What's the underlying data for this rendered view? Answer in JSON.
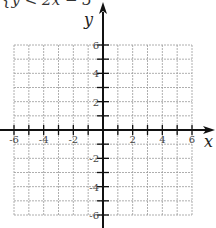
{
  "problem": {
    "inequality_text": "{y < 2x − 3"
  },
  "chart_data": {
    "type": "scatter",
    "title": "",
    "xlabel": "x",
    "ylabel": "y",
    "xlim": [
      -6,
      6
    ],
    "ylim": [
      -6,
      6
    ],
    "grid": true,
    "grid_style": "dashed",
    "grid_step": 1,
    "x_tick_labels": [
      "-6",
      "-4",
      "-2",
      "2",
      "4",
      "6"
    ],
    "x_tick_values": [
      -6,
      -4,
      -2,
      2,
      4,
      6
    ],
    "y_tick_labels": [
      "6",
      "4",
      "2",
      "-2",
      "-4",
      "-6"
    ],
    "y_tick_values": [
      6,
      4,
      2,
      -2,
      -4,
      -6
    ],
    "series": [],
    "annotations": [
      "y < 2x − 3 (partially cropped at top)"
    ],
    "legend": null
  },
  "colors": {
    "axis": "#111111",
    "grid": "#9a9a9a",
    "label": "#444444"
  }
}
